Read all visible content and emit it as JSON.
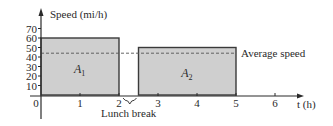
{
  "chart_data": {
    "type": "bar",
    "title": "",
    "xlabel": "t (h)",
    "ylabel": "Speed (mi/h)",
    "xlim": [
      0,
      6.7
    ],
    "ylim": [
      0,
      75
    ],
    "x_ticks": [
      0,
      1,
      2,
      3,
      4,
      5,
      6
    ],
    "x_tick_labels": [
      "0",
      "1",
      "2",
      "3",
      "4",
      "5",
      "6"
    ],
    "y_ticks": [
      10,
      20,
      30,
      40,
      50,
      60,
      70
    ],
    "y_tick_labels": [
      "10",
      "20",
      "30",
      "40",
      "50",
      "60",
      "70"
    ],
    "grid": false,
    "bars": [
      {
        "label": "A",
        "subscript": "1",
        "x_start": 0,
        "x_end": 2,
        "value": 60
      },
      {
        "label": "A",
        "subscript": "2",
        "x_start": 2.5,
        "x_end": 5,
        "value": 50
      }
    ],
    "reference_lines": [
      {
        "label": "Average speed",
        "value": 44,
        "style": "dashed"
      }
    ],
    "annotations": [
      {
        "text": "Lunch break",
        "x_start": 2,
        "x_end": 2.5,
        "type": "brace"
      }
    ]
  },
  "colors": {
    "bar_fill": "#cfcfcf",
    "bar_stroke": "#3a3a3a",
    "axis": "#2a2a2a",
    "text": "#2a2a2a",
    "background": "#ffffff"
  }
}
